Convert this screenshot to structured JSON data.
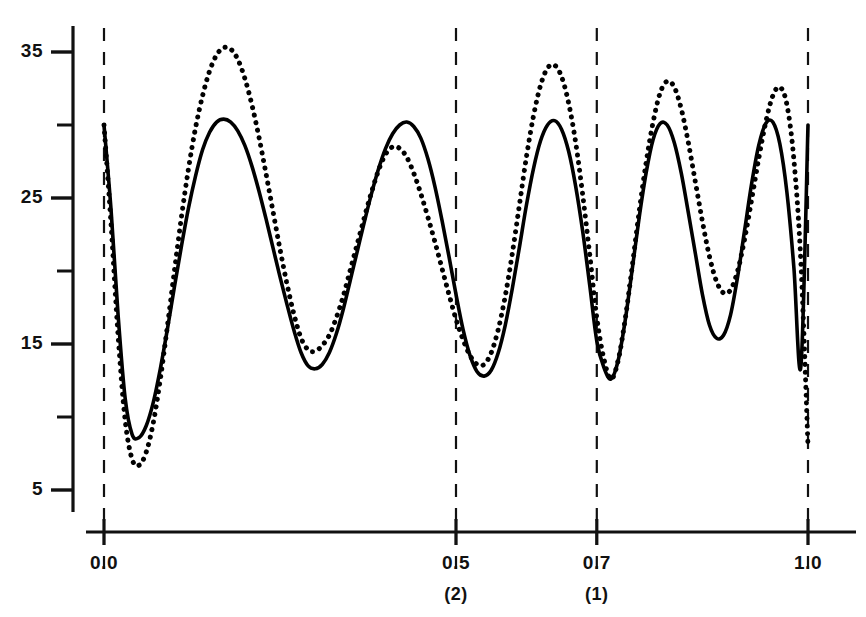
{
  "chart_data": {
    "type": "line",
    "title": "",
    "xlabel": "",
    "ylabel": "",
    "xlim": [
      -0.012,
      1.012
    ],
    "ylim": [
      3.2,
      37.4
    ],
    "grid": false,
    "legend": null,
    "x_ticks": [
      {
        "value": 0.0,
        "label": "0.0",
        "sublabel": ""
      },
      {
        "value": 0.5,
        "label": "0.5",
        "sublabel": "(2)"
      },
      {
        "value": 0.7,
        "label": "0.7",
        "sublabel": "(1)"
      },
      {
        "value": 1.0,
        "label": "1.0",
        "sublabel": ""
      }
    ],
    "y_ticks": [
      {
        "value": 35,
        "label": "35",
        "major": true
      },
      {
        "value": 30,
        "label": "",
        "major": false
      },
      {
        "value": 25,
        "label": "25",
        "major": true
      },
      {
        "value": 20,
        "label": "",
        "major": false
      },
      {
        "value": 15,
        "label": "15",
        "major": true
      },
      {
        "value": 10,
        "label": "",
        "major": false
      },
      {
        "value": 5,
        "label": "5",
        "major": true
      }
    ],
    "reference_lines": [
      {
        "x": 0.0,
        "style": "dashed"
      },
      {
        "x": 0.5,
        "style": "dashed"
      },
      {
        "x": 0.7,
        "style": "dashed"
      },
      {
        "x": 1.0,
        "style": "dashed"
      }
    ],
    "series": [
      {
        "name": "solid-curve",
        "style": "solid",
        "color": "#000000",
        "x": [
          0.0,
          0.01,
          0.02,
          0.03,
          0.04,
          0.05,
          0.06,
          0.07,
          0.08,
          0.09,
          0.1,
          0.11,
          0.12,
          0.13,
          0.14,
          0.15,
          0.16,
          0.17,
          0.18,
          0.19,
          0.2,
          0.21,
          0.22,
          0.23,
          0.24,
          0.25,
          0.26,
          0.27,
          0.28,
          0.29,
          0.3,
          0.31,
          0.32,
          0.33,
          0.34,
          0.35,
          0.36,
          0.37,
          0.38,
          0.39,
          0.4,
          0.41,
          0.42,
          0.43,
          0.44,
          0.45,
          0.46,
          0.47,
          0.48,
          0.49,
          0.5,
          0.51,
          0.52,
          0.53,
          0.54,
          0.55,
          0.56,
          0.57,
          0.58,
          0.59,
          0.6,
          0.61,
          0.62,
          0.63,
          0.64,
          0.65,
          0.66,
          0.67,
          0.68,
          0.69,
          0.7,
          0.71,
          0.72,
          0.73,
          0.74,
          0.75,
          0.76,
          0.77,
          0.78,
          0.79,
          0.8,
          0.81,
          0.82,
          0.83,
          0.84,
          0.85,
          0.86,
          0.87,
          0.88,
          0.89,
          0.9,
          0.91,
          0.92,
          0.93,
          0.94,
          0.95,
          0.96,
          0.97,
          0.98,
          0.99,
          1.0
        ],
        "y": [
          30.0,
          24.2,
          17.0,
          11.3,
          8.8,
          8.6,
          9.4,
          11.0,
          13.3,
          16.0,
          18.9,
          21.7,
          24.3,
          26.5,
          28.3,
          29.5,
          30.2,
          30.4,
          30.2,
          29.6,
          28.6,
          27.2,
          25.5,
          23.6,
          21.6,
          19.6,
          17.7,
          15.9,
          14.4,
          13.5,
          13.3,
          13.6,
          14.4,
          15.7,
          17.4,
          19.4,
          21.4,
          23.4,
          25.3,
          27.0,
          28.4,
          29.4,
          30.0,
          30.2,
          29.9,
          29.1,
          27.7,
          25.8,
          23.5,
          21.0,
          18.4,
          16.0,
          14.2,
          13.1,
          12.8,
          13.2,
          14.4,
          16.3,
          18.8,
          21.6,
          24.5,
          27.0,
          28.9,
          30.0,
          30.3,
          29.7,
          28.2,
          25.8,
          22.7,
          19.0,
          15.2,
          13.4,
          12.6,
          13.8,
          16.5,
          20.0,
          23.6,
          26.7,
          29.0,
          30.1,
          30.0,
          28.8,
          26.7,
          24.0,
          21.2,
          18.4,
          16.3,
          15.4,
          15.6,
          17.0,
          19.6,
          22.8,
          26.0,
          28.6,
          30.1,
          30.2,
          28.7,
          25.4,
          20.2,
          13.5,
          30.0
        ]
      },
      {
        "name": "dotted-curve",
        "style": "dotted",
        "color": "#000000",
        "x": [
          0.0,
          0.01,
          0.02,
          0.03,
          0.04,
          0.05,
          0.06,
          0.07,
          0.08,
          0.09,
          0.1,
          0.11,
          0.12,
          0.13,
          0.14,
          0.15,
          0.16,
          0.17,
          0.18,
          0.19,
          0.2,
          0.21,
          0.22,
          0.23,
          0.24,
          0.25,
          0.26,
          0.27,
          0.28,
          0.29,
          0.3,
          0.31,
          0.32,
          0.33,
          0.34,
          0.35,
          0.36,
          0.37,
          0.38,
          0.39,
          0.4,
          0.41,
          0.42,
          0.43,
          0.44,
          0.45,
          0.46,
          0.47,
          0.48,
          0.49,
          0.5,
          0.51,
          0.52,
          0.53,
          0.54,
          0.55,
          0.56,
          0.57,
          0.58,
          0.59,
          0.6,
          0.61,
          0.62,
          0.63,
          0.64,
          0.65,
          0.66,
          0.67,
          0.68,
          0.69,
          0.7,
          0.71,
          0.72,
          0.73,
          0.74,
          0.75,
          0.76,
          0.77,
          0.78,
          0.79,
          0.8,
          0.81,
          0.82,
          0.83,
          0.84,
          0.85,
          0.86,
          0.87,
          0.88,
          0.89,
          0.9,
          0.91,
          0.92,
          0.93,
          0.94,
          0.95,
          0.96,
          0.97,
          0.98,
          0.99,
          1.0
        ],
        "y": [
          30.0,
          23.2,
          15.6,
          9.8,
          7.1,
          6.7,
          7.6,
          9.6,
          12.6,
          16.2,
          20.0,
          23.7,
          27.0,
          29.8,
          32.0,
          33.7,
          34.8,
          35.3,
          35.2,
          34.5,
          33.2,
          31.4,
          29.2,
          26.7,
          24.1,
          21.5,
          19.1,
          17.0,
          15.4,
          14.6,
          14.5,
          14.9,
          15.6,
          16.8,
          18.3,
          20.1,
          21.9,
          23.7,
          25.4,
          26.9,
          28.0,
          28.5,
          28.4,
          27.8,
          26.7,
          25.3,
          23.7,
          22.0,
          20.2,
          18.4,
          16.7,
          15.3,
          14.2,
          13.6,
          13.6,
          14.4,
          16.0,
          18.3,
          21.2,
          24.5,
          27.8,
          30.6,
          32.7,
          33.9,
          34.1,
          33.3,
          31.5,
          28.8,
          25.2,
          21.1,
          16.8,
          14.0,
          12.6,
          13.8,
          16.6,
          20.2,
          24.0,
          27.4,
          30.2,
          32.2,
          33.0,
          32.6,
          31.1,
          28.8,
          26.1,
          23.4,
          21.0,
          19.3,
          18.5,
          18.7,
          20.0,
          22.2,
          24.9,
          27.7,
          30.2,
          32.0,
          32.6,
          31.4,
          27.6,
          20.5,
          8.0
        ]
      }
    ]
  },
  "axes": {
    "y_axis_name": "y-axis",
    "x_axis_name": "x-axis"
  }
}
